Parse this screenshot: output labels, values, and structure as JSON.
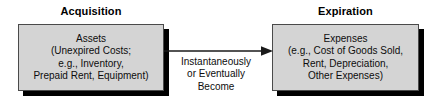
{
  "diagram": {
    "type": "flow",
    "title": "",
    "headings": {
      "left": "Acquisition",
      "right": "Expiration"
    },
    "left_box": {
      "lines": [
        "Assets",
        "(Unexpired Costs;",
        "e.g., Inventory,",
        "Prepaid Rent, Equipment)"
      ]
    },
    "right_box": {
      "lines": [
        "Expenses",
        "(e.g., Cost of Goods Sold,",
        "Rent, Depreciation,",
        "Other Expenses)"
      ]
    },
    "arrow": {
      "icon": "arrow-right-icon",
      "direction": "left-to-right",
      "caption_lines": [
        "Instantaneously",
        "or Eventually",
        "Become"
      ]
    },
    "colors": {
      "box_fill": "#d4d4d4",
      "box_border": "#4a4a4a",
      "box_shadow": "#000000",
      "arrow": "#1a1a1a",
      "text": "#0d0d0d",
      "background": "#ffffff"
    }
  }
}
